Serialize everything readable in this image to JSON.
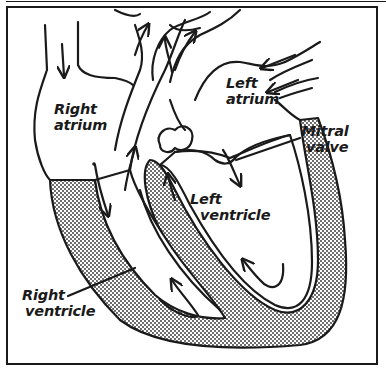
{
  "figure": {
    "colors": {
      "ink": "#1a1a1a",
      "background": "#ffffff",
      "muscle_stipple": "#2a2a2a"
    },
    "labels": {
      "right_atrium": {
        "line1": "Right",
        "line2": "atrium"
      },
      "left_atrium": {
        "line1": "Left",
        "line2": "atrium"
      },
      "mitral_valve": {
        "line1": "Mitral",
        "line2": "valve"
      },
      "left_ventricle": {
        "line1": "Left",
        "line2": "ventricle"
      },
      "right_ventricle": {
        "line1": "Right",
        "line2": "ventricle"
      }
    }
  }
}
